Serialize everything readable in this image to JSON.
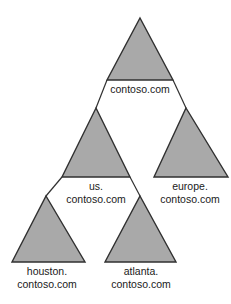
{
  "diagram": {
    "type": "domain-tree",
    "canvas": {
      "width": 231,
      "height": 304
    },
    "style": {
      "background_color": "#ffffff",
      "triangle_fill": "#a9a9a9",
      "triangle_stroke": "#303030",
      "triangle_stroke_width": 1.4,
      "connector_stroke": "#303030",
      "connector_stroke_width": 1.2,
      "label_color": "#1a1a1a",
      "label_font_size": 10.5
    },
    "nodes": [
      {
        "id": "root",
        "label_lines": [
          "contoso.com"
        ],
        "label_text": "contoso.com",
        "level": 0,
        "apex": {
          "x": 140,
          "y": 18
        },
        "base_y": 80,
        "base_left_x": 107,
        "base_right_x": 173,
        "label_x": 140,
        "label_first_line_y": 93
      },
      {
        "id": "us",
        "label_lines": [
          "us.",
          "contoso.com"
        ],
        "label_text": "us. contoso.com",
        "level": 1,
        "apex": {
          "x": 96,
          "y": 108
        },
        "base_y": 177,
        "base_left_x": 62,
        "base_right_x": 130,
        "label_x": 96,
        "label_first_line_y": 190
      },
      {
        "id": "europe",
        "label_lines": [
          "europe.",
          "contoso.com"
        ],
        "label_text": "europe. contoso.com",
        "level": 1,
        "apex": {
          "x": 186,
          "y": 108
        },
        "base_y": 177,
        "base_left_x": 154,
        "base_right_x": 228,
        "label_x": 190,
        "label_first_line_y": 190
      },
      {
        "id": "houston",
        "label_lines": [
          "houston.",
          "contoso.com"
        ],
        "label_text": "houston. contoso.com",
        "level": 2,
        "apex": {
          "x": 46,
          "y": 196
        },
        "base_y": 262,
        "base_left_x": 12,
        "base_right_x": 85,
        "label_x": 47,
        "label_first_line_y": 275
      },
      {
        "id": "atlanta",
        "label_lines": [
          "atlanta.",
          "contoso.com"
        ],
        "label_text": "atlanta. contoso.com",
        "level": 2,
        "apex": {
          "x": 140,
          "y": 196
        },
        "base_y": 262,
        "base_left_x": 105,
        "base_right_x": 176,
        "label_x": 141,
        "label_first_line_y": 275
      }
    ],
    "connectors": [
      {
        "id": "root-to-us",
        "from": "root",
        "to": "us",
        "x1": 107,
        "y1": 80,
        "x2": 96,
        "y2": 108
      },
      {
        "id": "root-to-europe",
        "from": "root",
        "to": "europe",
        "x1": 173,
        "y1": 80,
        "x2": 186,
        "y2": 108
      },
      {
        "id": "us-to-houston",
        "from": "us",
        "to": "houston",
        "x1": 62,
        "y1": 177,
        "x2": 46,
        "y2": 196
      },
      {
        "id": "us-to-atlanta",
        "from": "us",
        "to": "atlanta",
        "x1": 130,
        "y1": 177,
        "x2": 140,
        "y2": 196
      }
    ]
  }
}
